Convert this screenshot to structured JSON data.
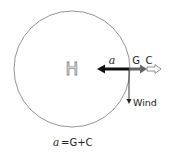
{
  "diagram": {
    "center_label": "H",
    "arrows": {
      "a_label": "a",
      "g_label": "G",
      "c_label": "C",
      "wind_label": "Wind"
    },
    "equation": {
      "lhs": "a",
      "rhs": "=G+C"
    },
    "colors": {
      "circle": "#777777",
      "a_arrow": "#111111",
      "g_arrow": "#666666",
      "c_arrow_stroke": "#777777",
      "wind_arrow": "#222222",
      "h_glyph": "#888888"
    }
  }
}
